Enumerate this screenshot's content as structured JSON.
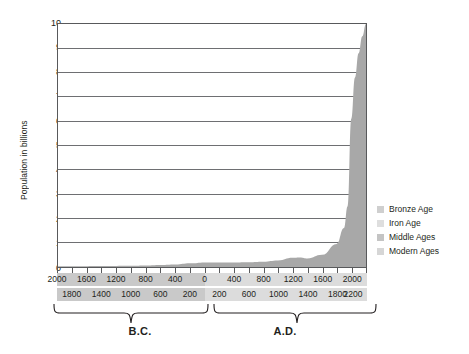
{
  "chart_data": {
    "type": "area",
    "title": "",
    "xlabel": "",
    "ylabel": "Population in billions",
    "ylim": [
      0,
      10
    ],
    "yticks": [
      0,
      1,
      2,
      3,
      4,
      5,
      6,
      7,
      8,
      9,
      10
    ],
    "grid": true,
    "legend_position": "right",
    "xlim": [
      -2000,
      2200
    ],
    "x_axis_bands": {
      "row1": {
        "bc": [
          "2000",
          "1600",
          "1200",
          "800",
          "400",
          "0"
        ],
        "ad": [
          "400",
          "800",
          "1200",
          "1600",
          "2000"
        ]
      },
      "row2": {
        "bc": [
          "1800",
          "1400",
          "1000",
          "600",
          "200"
        ],
        "ad": [
          "200",
          "600",
          "1000",
          "1400",
          "1800",
          "2200"
        ]
      }
    },
    "era_labels": [
      "B.C.",
      "A.D."
    ],
    "legend": [
      {
        "label": "Bronze Age",
        "color": "#cfcfcf"
      },
      {
        "label": "Iron Age",
        "color": "#dedede"
      },
      {
        "label": "Middle Ages",
        "color": "#c4c4c4"
      },
      {
        "label": "Modern Ages",
        "color": "#d6d6d6"
      }
    ],
    "series": [
      {
        "name": "World population",
        "fill_color": "#a8a8a8",
        "x": [
          -2000,
          -1800,
          -1600,
          -1400,
          -1200,
          -1000,
          -800,
          -600,
          -400,
          -200,
          0,
          200,
          400,
          600,
          800,
          1000,
          1200,
          1300,
          1400,
          1600,
          1800,
          1900,
          1950,
          2000,
          2050,
          2100,
          2150,
          2200
        ],
        "values": [
          0.027,
          0.03,
          0.035,
          0.04,
          0.045,
          0.05,
          0.06,
          0.08,
          0.1,
          0.15,
          0.19,
          0.19,
          0.19,
          0.2,
          0.22,
          0.27,
          0.38,
          0.39,
          0.35,
          0.5,
          0.95,
          1.6,
          2.5,
          6.1,
          7.8,
          8.8,
          9.5,
          10.0
        ]
      }
    ]
  }
}
